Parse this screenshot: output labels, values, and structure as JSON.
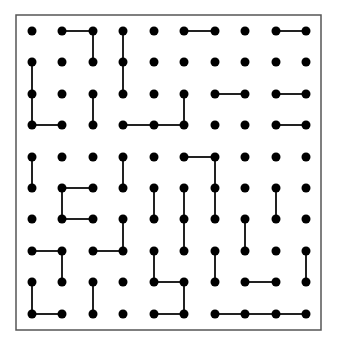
{
  "board": {
    "cols": 10,
    "rows": 10,
    "col_x": [
      32,
      62,
      93,
      123,
      154,
      184,
      215,
      245,
      276,
      306
    ],
    "row_y": [
      31,
      62,
      94,
      125,
      157,
      188,
      219,
      251,
      282,
      314
    ],
    "border": {
      "x": 16,
      "y": 15,
      "width": 305,
      "height": 315,
      "color": "#555555"
    },
    "dot_color": "#000000",
    "line_color": "#222222",
    "dot_radius": 4.5,
    "horizontal_lines": [
      [
        0,
        1,
        2
      ],
      [
        0,
        5,
        6
      ],
      [
        0,
        8,
        9
      ],
      [
        2,
        6,
        7
      ],
      [
        2,
        8,
        9
      ],
      [
        3,
        0,
        1
      ],
      [
        3,
        3,
        4
      ],
      [
        3,
        4,
        5
      ],
      [
        3,
        8,
        9
      ],
      [
        4,
        5,
        6
      ],
      [
        5,
        1,
        2
      ],
      [
        6,
        1,
        2
      ],
      [
        7,
        0,
        1
      ],
      [
        7,
        2,
        3
      ],
      [
        8,
        4,
        5
      ],
      [
        8,
        7,
        8
      ],
      [
        9,
        0,
        1
      ],
      [
        9,
        4,
        5
      ],
      [
        9,
        6,
        7
      ],
      [
        9,
        7,
        8
      ],
      [
        9,
        8,
        9
      ]
    ],
    "vertical_lines": [
      [
        2,
        0,
        1
      ],
      [
        3,
        0,
        1
      ],
      [
        3,
        1,
        2
      ],
      [
        0,
        1,
        2
      ],
      [
        0,
        2,
        3
      ],
      [
        2,
        2,
        3
      ],
      [
        5,
        2,
        3
      ],
      [
        0,
        4,
        5
      ],
      [
        3,
        4,
        5
      ],
      [
        6,
        4,
        5
      ],
      [
        6,
        5,
        6
      ],
      [
        1,
        5,
        6
      ],
      [
        4,
        5,
        6
      ],
      [
        5,
        5,
        6
      ],
      [
        5,
        6,
        7
      ],
      [
        8,
        5,
        6
      ],
      [
        3,
        6,
        7
      ],
      [
        7,
        6,
        7
      ],
      [
        1,
        7,
        8
      ],
      [
        4,
        7,
        8
      ],
      [
        6,
        7,
        8
      ],
      [
        9,
        7,
        8
      ],
      [
        0,
        8,
        9
      ],
      [
        2,
        8,
        9
      ],
      [
        5,
        8,
        9
      ]
    ]
  }
}
